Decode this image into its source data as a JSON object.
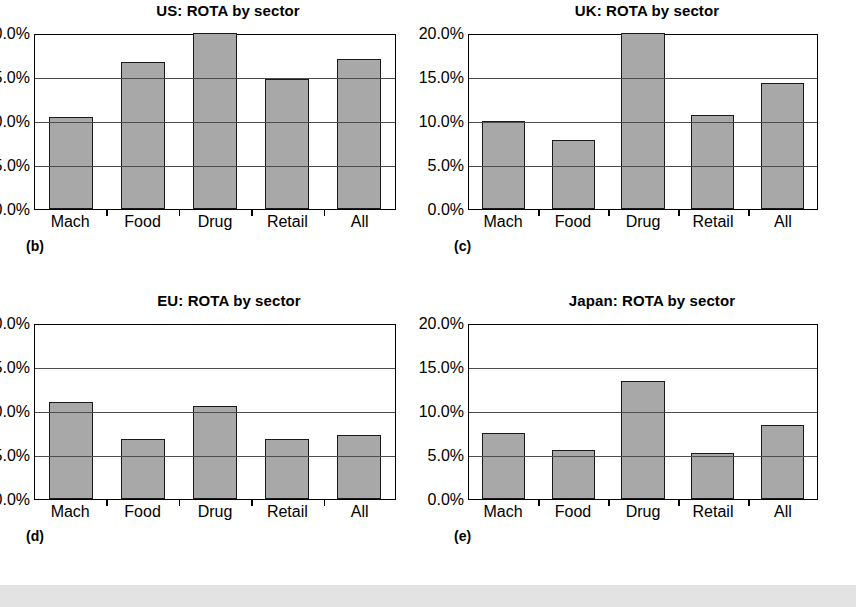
{
  "figure": {
    "background": "#ffffff",
    "footer_strip_color": "#e3e3e3",
    "bar_fill_color": "#a8a8a8",
    "bar_stroke_color": "#1a1a1a"
  },
  "panels": [
    {
      "id": "b",
      "panel_label": "(b)",
      "chart_data": {
        "type": "bar",
        "title": "US: ROTA by sector",
        "xlabel": "",
        "ylabel": "",
        "categories": [
          "Mach",
          "Food",
          "Drug",
          "Retail",
          "All"
        ],
        "values": [
          10.5,
          16.7,
          20.0,
          14.8,
          17.0
        ],
        "value_labels": [
          "10.5%",
          "16.7%",
          "20.0%",
          "14.8%",
          "17.0%"
        ],
        "ylim": [
          0,
          20
        ],
        "yticks": [
          0,
          5,
          10,
          15,
          20
        ],
        "ytick_labels": [
          "0.0%",
          "5.0%",
          "10.0%",
          "15.0%",
          "20.0%"
        ],
        "grid": true,
        "legend": false
      }
    },
    {
      "id": "c",
      "panel_label": "(c)",
      "chart_data": {
        "type": "bar",
        "title": "UK: ROTA by sector",
        "xlabel": "",
        "ylabel": "",
        "categories": [
          "Mach",
          "Food",
          "Drug",
          "Retail",
          "All"
        ],
        "values": [
          10.0,
          7.8,
          20.0,
          10.7,
          14.3
        ],
        "value_labels": [
          "10.0%",
          "7.8%",
          "20.0%",
          "10.7%",
          "14.3%"
        ],
        "ylim": [
          0,
          20
        ],
        "yticks": [
          0,
          5,
          10,
          15,
          20
        ],
        "ytick_labels": [
          "0.0%",
          "5.0%",
          "10.0%",
          "15.0%",
          "20.0%"
        ],
        "grid": true,
        "legend": false
      }
    },
    {
      "id": "d",
      "panel_label": "(d)",
      "chart_data": {
        "type": "bar",
        "title": "EU: ROTA by sector",
        "xlabel": "",
        "ylabel": "",
        "categories": [
          "Mach",
          "Food",
          "Drug",
          "Retail",
          "All"
        ],
        "values": [
          11.0,
          6.8,
          10.6,
          6.8,
          7.3
        ],
        "value_labels": [
          "11.0%",
          "6.8%",
          "10.6%",
          "6.8%",
          "7.3%"
        ],
        "ylim": [
          0,
          20
        ],
        "yticks": [
          0,
          5,
          10,
          15,
          20
        ],
        "ytick_labels": [
          "0.0%",
          "5.0%",
          "10.0%",
          "15.0%",
          "20.0%"
        ],
        "grid": true,
        "legend": false
      }
    },
    {
      "id": "e",
      "panel_label": "(e)",
      "chart_data": {
        "type": "bar",
        "title": "Japan: ROTA by sector",
        "xlabel": "",
        "ylabel": "",
        "categories": [
          "Mach",
          "Food",
          "Drug",
          "Retail",
          "All"
        ],
        "values": [
          7.5,
          5.6,
          13.4,
          5.2,
          8.4
        ],
        "value_labels": [
          "7.5%",
          "5.6%",
          "13.4%",
          "5.2%",
          "8.4%"
        ],
        "ylim": [
          0,
          20
        ],
        "yticks": [
          0,
          5,
          10,
          15,
          20
        ],
        "ytick_labels": [
          "0.0%",
          "5.0%",
          "10.0%",
          "15.0%",
          "20.0%"
        ],
        "grid": true,
        "legend": false
      }
    }
  ]
}
